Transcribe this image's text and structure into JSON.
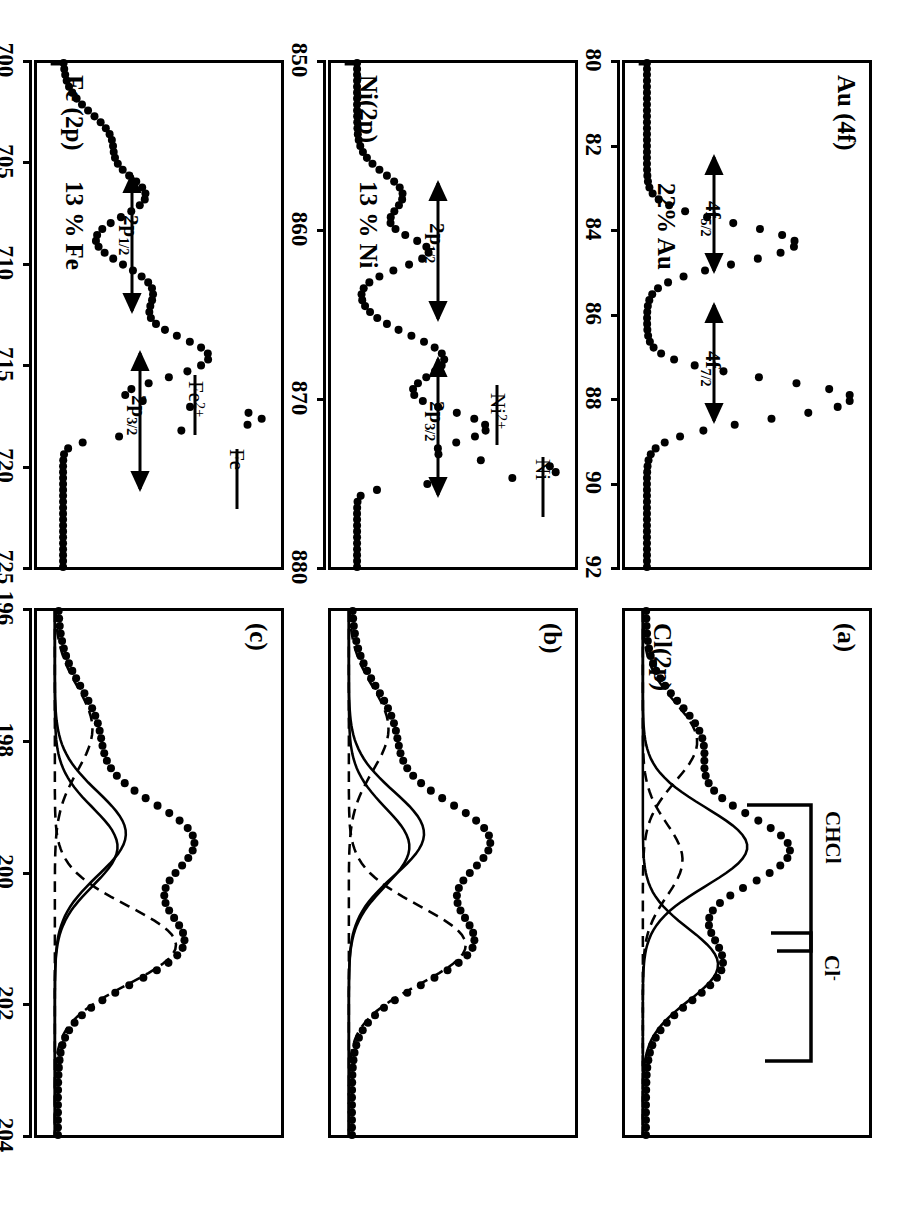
{
  "figure": {
    "axis_title": "Binding Energy (eV)",
    "orientation_deg": 90
  },
  "panels": [
    {
      "id": "cl-a",
      "panel_label": "(a)",
      "title": "Cl(2p)",
      "annotations": [
        "CHCl",
        "Cl⁻"
      ],
      "axis": {
        "ticks": [
          "196",
          "198",
          "200",
          "202",
          "204"
        ]
      }
    },
    {
      "id": "cl-b",
      "panel_label": "(b)",
      "title": "",
      "annotations": [],
      "axis": {
        "ticks": []
      }
    },
    {
      "id": "cl-c",
      "panel_label": "(c)",
      "title": "",
      "annotations": [],
      "axis": {
        "ticks": []
      }
    },
    {
      "id": "au",
      "panel_label": "",
      "title": "Au (4f)",
      "percent": "22% Au",
      "annotations": [
        "4f",
        "4f"
      ],
      "axis": {
        "ticks": [
          "80",
          "82",
          "84",
          "86",
          "88",
          "90",
          "92"
        ]
      }
    },
    {
      "id": "ni",
      "panel_label": "",
      "title": "Ni(2p)",
      "percent": "13 % Ni",
      "annotations": [
        "Ni",
        "Ni",
        "2p",
        "2p"
      ],
      "axis": {
        "ticks": [
          "850",
          "860",
          "870",
          "880"
        ]
      }
    },
    {
      "id": "fe",
      "panel_label": "",
      "title": "Fe (2p)",
      "percent": "13 % Fe",
      "annotations": [
        "Fe",
        "Fe",
        "2p",
        "2p"
      ],
      "axis": {
        "ticks": [
          "700",
          "705",
          "710",
          "715",
          "720",
          "725"
        ]
      }
    }
  ],
  "labels": {
    "cl_title": "Cl(2p)",
    "cl_panel_a": "(a)",
    "cl_panel_b": "(b)",
    "cl_panel_c": "(c)",
    "cl_ann_chcl": "CHCl",
    "cl_ann_clminus": "Cl",
    "cl_ann_clminus_sup": "-",
    "au_title": "Au (4f)",
    "au_percent": "22% Au",
    "au_ann_72_base": "4f",
    "au_ann_72_sub": "7/2",
    "au_ann_52_base": "4f",
    "au_ann_52_sub": "5/2",
    "ni_title": "Ni(2p)",
    "ni_percent": "13 % Ni",
    "ni_ann_metal": "Ni",
    "ni_ann_ion_base": "Ni",
    "ni_ann_ion_sup": "2+",
    "ni_ann_32_base": "2p",
    "ni_ann_32_sub": "3/2",
    "ni_ann_12_base": "2p",
    "ni_ann_12_sub": "1/2",
    "fe_title": "Fe (2p)",
    "fe_percent": "13 % Fe",
    "fe_ann_metal": "Fe",
    "fe_ann_ion_base": "Fe",
    "fe_ann_ion_sup": "2+",
    "fe_ann_32_base": "2p",
    "fe_ann_32_sub": "3/2",
    "fe_ann_12_base": "2p",
    "fe_ann_12_sub": "1/2",
    "axis_title": "Binding Energy (eV)"
  },
  "axes": {
    "cl": {
      "ticks": [
        "196",
        "198",
        "200",
        "202",
        "204"
      ],
      "min": 196,
      "max": 204,
      "unit": "eV"
    },
    "au": {
      "ticks": [
        "80",
        "82",
        "84",
        "86",
        "88",
        "90",
        "92"
      ],
      "min": 80,
      "max": 92,
      "unit": "eV"
    },
    "ni": {
      "ticks": [
        "850",
        "860",
        "870",
        "880"
      ],
      "min": 845,
      "max": 885,
      "unit": "eV"
    },
    "fe": {
      "ticks": [
        "700",
        "705",
        "710",
        "715",
        "720",
        "725"
      ],
      "min": 698,
      "max": 728,
      "unit": "eV"
    }
  },
  "chart_data": {
    "type": "line",
    "xlabel": "Binding Energy (eV)",
    "ylabel": "Intensity (a.u.)",
    "grid": false,
    "legend": "none",
    "subplots": [
      {
        "key": "cl-a",
        "panel_label": "(a)",
        "title": "Cl(2p)",
        "xlabel": "Binding Energy (eV)",
        "xlim": [
          204,
          196
        ],
        "xticks": [
          196,
          198,
          200,
          202,
          204
        ],
        "annotations": [
          "CHCl",
          "Cl-"
        ],
        "series": [
          {
            "name": "measured (dots)",
            "style": "dotted-markers",
            "x": [
              204.0,
              203.6,
              203.2,
              202.8,
              202.4,
              202.0,
              201.6,
              201.2,
              200.8,
              200.4,
              200.0,
              199.6,
              199.2,
              198.8,
              198.4,
              198.0,
              197.6,
              197.2,
              196.8,
              196.4,
              196.0
            ],
            "y": [
              0.04,
              0.05,
              0.07,
              0.1,
              0.16,
              0.26,
              0.4,
              0.56,
              0.72,
              0.86,
              0.95,
              0.92,
              0.86,
              0.84,
              0.8,
              0.68,
              0.5,
              0.33,
              0.2,
              0.11,
              0.06
            ]
          },
          {
            "name": "fit component CHCl 2p3/2 (solid)",
            "style": "solid",
            "peak_center": 200.4,
            "peak_height": 0.5,
            "fwhm": 1.4
          },
          {
            "name": "fit component CHCl 2p1/2 (dashed)",
            "style": "dashed",
            "peak_center": 202.0,
            "peak_height": 0.26,
            "fwhm": 1.4
          },
          {
            "name": "fit component Cl- 2p3/2 (solid)",
            "style": "solid",
            "peak_center": 198.6,
            "peak_height": 0.36,
            "fwhm": 1.3
          },
          {
            "name": "fit component Cl- 2p1/2 (dashed)",
            "style": "dashed",
            "peak_center": 200.2,
            "peak_height": 0.19,
            "fwhm": 1.3
          }
        ]
      },
      {
        "key": "cl-b",
        "panel_label": "(b)",
        "title": "Cl(2p)",
        "xlim": [
          204,
          196
        ],
        "xticks": [
          196,
          198,
          200,
          202,
          204
        ],
        "series": [
          {
            "name": "measured (dots)",
            "style": "dotted-markers",
            "x": [
              204.0,
              203.6,
              203.2,
              202.8,
              202.4,
              202.0,
              201.6,
              201.2,
              200.8,
              200.4,
              200.0,
              199.6,
              199.2,
              198.8,
              198.4,
              198.0,
              197.6,
              197.2,
              196.8,
              196.4,
              196.0
            ],
            "y": [
              0.04,
              0.05,
              0.08,
              0.13,
              0.22,
              0.35,
              0.52,
              0.66,
              0.78,
              0.83,
              0.88,
              0.96,
              0.9,
              0.76,
              0.57,
              0.4,
              0.27,
              0.17,
              0.1,
              0.06,
              0.04
            ]
          },
          {
            "name": "fit CHCl 2p3/2 (solid)",
            "style": "solid",
            "peak_center": 200.6,
            "peak_height": 0.36,
            "fwhm": 1.5
          },
          {
            "name": "fit CHCl 2p1/2 (dashed)",
            "style": "dashed",
            "peak_center": 202.2,
            "peak_height": 0.19,
            "fwhm": 1.5
          },
          {
            "name": "fit Cl- 2p3/2 (dashed)",
            "style": "dashed",
            "peak_center": 198.9,
            "peak_height": 0.56,
            "fwhm": 1.4
          },
          {
            "name": "fit Cl- 2p1/2 (solid)",
            "style": "solid",
            "peak_center": 200.4,
            "peak_height": 0.29,
            "fwhm": 1.4
          }
        ]
      },
      {
        "key": "cl-c",
        "panel_label": "(c)",
        "title": "Cl(2p)",
        "xlim": [
          204,
          196
        ],
        "xticks": [
          196,
          198,
          200,
          202,
          204
        ],
        "series": [
          {
            "name": "measured (dots)",
            "style": "dotted-markers",
            "x": [
              204.0,
              203.6,
              203.2,
              202.8,
              202.4,
              202.0,
              201.6,
              201.2,
              200.8,
              200.4,
              200.0,
              199.6,
              199.2,
              198.8,
              198.4,
              198.0,
              197.6,
              197.2,
              196.8,
              196.4,
              196.0
            ],
            "y": [
              0.04,
              0.06,
              0.09,
              0.15,
              0.25,
              0.38,
              0.54,
              0.68,
              0.8,
              0.86,
              0.9,
              0.97,
              0.92,
              0.78,
              0.58,
              0.41,
              0.27,
              0.17,
              0.1,
              0.06,
              0.04
            ]
          },
          {
            "name": "fit CHCl 2p3/2 (solid)",
            "style": "solid",
            "peak_center": 200.6,
            "peak_height": 0.34,
            "fwhm": 1.5
          },
          {
            "name": "fit CHCl 2p1/2 (dashed)",
            "style": "dashed",
            "peak_center": 202.2,
            "peak_height": 0.18,
            "fwhm": 1.5
          },
          {
            "name": "fit Cl- 2p3/2 (dashed)",
            "style": "dashed",
            "peak_center": 198.9,
            "peak_height": 0.58,
            "fwhm": 1.4
          },
          {
            "name": "fit Cl- 2p1/2 (solid)",
            "style": "solid",
            "peak_center": 200.4,
            "peak_height": 0.3,
            "fwhm": 1.4
          }
        ]
      },
      {
        "key": "au",
        "title": "Au (4f)",
        "label": "22% Au",
        "xlim": [
          92,
          80
        ],
        "xticks": [
          80,
          82,
          84,
          86,
          88,
          90,
          92
        ],
        "annotations": [
          "4f7/2",
          "4f5/2"
        ],
        "series": [
          {
            "name": "Au 4f measured (dots)",
            "style": "dotted-markers",
            "peaks": [
              {
                "label": "4f7/2",
                "center": 84.0,
                "height": 1.0,
                "fwhm": 1.1
              },
              {
                "label": "4f5/2",
                "center": 87.7,
                "height": 0.72,
                "fwhm": 1.1
              }
            ],
            "baseline": 0.04
          }
        ]
      },
      {
        "key": "ni",
        "title": "Ni(2p)",
        "label": "13 % Ni",
        "xlim": [
          885,
          845
        ],
        "xticks": [
          850,
          860,
          870,
          880
        ],
        "annotations": [
          "Ni",
          "Ni2+",
          "2p3/2",
          "2p1/2"
        ],
        "marker_lines": [
          {
            "label": "Ni",
            "x": 852.6
          },
          {
            "label": "Ni2+",
            "x": 856.0
          }
        ],
        "series": [
          {
            "name": "Ni 2p measured (dots)",
            "style": "dotted-markers",
            "peaks": [
              {
                "label": "2p3/2 metal",
                "center": 852.6,
                "height": 1.0,
                "fwhm": 1.6
              },
              {
                "label": "2p3/2 Ni2+",
                "center": 856.0,
                "height": 0.62,
                "fwhm": 3.6
              },
              {
                "label": "satellite",
                "center": 861.5,
                "height": 0.42,
                "fwhm": 4.5
              },
              {
                "label": "2p1/2",
                "center": 870.0,
                "height": 0.34,
                "fwhm": 3.0
              },
              {
                "label": "2p1/2 sat",
                "center": 874.5,
                "height": 0.22,
                "fwhm": 4.0
              }
            ],
            "baseline": 0.06
          }
        ]
      },
      {
        "key": "fe",
        "title": "Fe (2p)",
        "label": "13 % Fe",
        "xlim": [
          728,
          698
        ],
        "xticks": [
          700,
          705,
          710,
          715,
          720,
          725
        ],
        "annotations": [
          "Fe",
          "Fe2+",
          "2p3/2",
          "2p1/2"
        ],
        "marker_lines": [
          {
            "label": "Fe",
            "x": 706.8
          },
          {
            "label": "Fe2+",
            "x": 710.4
          }
        ],
        "series": [
          {
            "name": "Fe 2p measured (dots)",
            "style": "dotted-markers",
            "peaks": [
              {
                "label": "2p3/2 metal",
                "center": 706.8,
                "height": 1.0,
                "fwhm": 1.5
              },
              {
                "label": "2p3/2 Fe2+",
                "center": 710.4,
                "height": 0.68,
                "fwhm": 3.4
              },
              {
                "label": "satellite",
                "center": 714.5,
                "height": 0.42,
                "fwhm": 4.0
              },
              {
                "label": "2p1/2",
                "center": 720.0,
                "height": 0.38,
                "fwhm": 3.2
              },
              {
                "label": "2p1/2 sat",
                "center": 723.5,
                "height": 0.22,
                "fwhm": 3.6
              }
            ],
            "baseline": 0.06
          }
        ]
      }
    ]
  }
}
